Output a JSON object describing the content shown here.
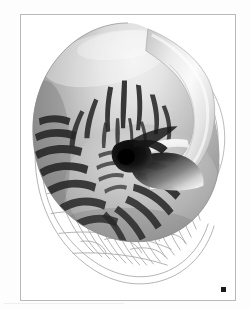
{
  "figure": {
    "title_remnant": "· ·   ·",
    "registration_mark_label": "",
    "frame": {
      "border_color": "#b9b9bd",
      "background": "#ffffff"
    },
    "palette": {
      "paper": "#ffffff",
      "page": "#fdfdfd",
      "shell_highlight": "#f4f4f4",
      "shell_light": "#dcdcdc",
      "shell_mid": "#a8a8a8",
      "shell_dark": "#6e6e6e",
      "shell_shadow": "#3a3a3a",
      "stripe": "#1f1f1f",
      "hub": "#0c0c0c",
      "wire": "#9b9ba0",
      "caption_ghost": "#d9d9d9",
      "reg_mark": "#1b1b1b"
    },
    "parts": {
      "body_whorl": "body-whorl",
      "aperture": "aperture-lip",
      "hood": "shell-hood",
      "umbilicus": "central-umbilicus",
      "stripes": "flame-stripe-pattern",
      "wireframe": "wireframe-underlay"
    }
  }
}
